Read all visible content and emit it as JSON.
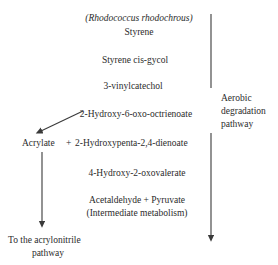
{
  "diagram": {
    "title": "(Rhodococcus rhodochrous)",
    "organism_italic": true,
    "side_label": "Aerobic degradation pathway",
    "side_label_lines": [
      "Aerobic",
      "degradation",
      "pathway"
    ],
    "steps": [
      {
        "id": "styrene",
        "label": "Styrene"
      },
      {
        "id": "styrene-cis-gycol",
        "label": "Styrene cis-gycol"
      },
      {
        "id": "3-vinylcatechol",
        "label": "3-vinylcatechol"
      },
      {
        "id": "2-hydroxy-6-oxo-octrienoate",
        "label": "2-Hydroxy-6-oxo-octrienoate"
      },
      {
        "id": "4-hydroxy-2-oxovalerate",
        "label": "4-Hydroxy-2-oxovalerate"
      },
      {
        "id": "acetaldehyde-pyruvate",
        "label": "Acetaldehyde + Pyruvate"
      },
      {
        "id": "intermediate-metabolism",
        "label": "(Intermediate metabolism)"
      }
    ],
    "branch_row": {
      "left_label": "Acrylate",
      "plus": "+",
      "right_label": "2-Hydroxypenta-2,4-dienoate"
    },
    "branch_outcome": {
      "line1": "To the acrylonitrile",
      "line2": "pathway"
    },
    "colors": {
      "text": "#2b2b2b",
      "stroke": "#3a3a3a",
      "background": "#ffffff"
    }
  }
}
